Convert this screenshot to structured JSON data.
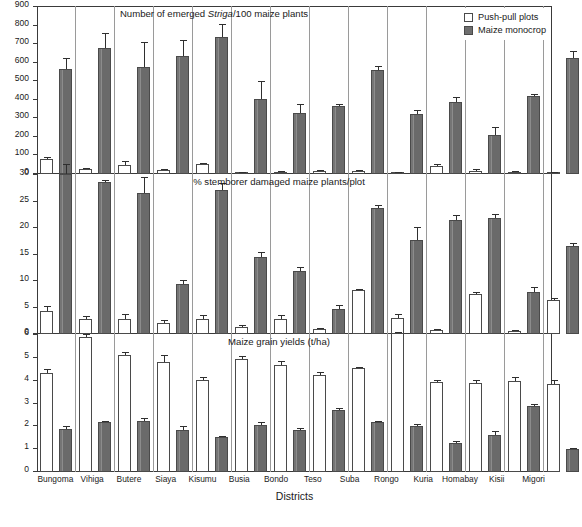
{
  "figure": {
    "xlabel": "Districts",
    "legend": [
      {
        "label": "Push-pull plots",
        "key": "push",
        "color": "#ffffff"
      },
      {
        "label": "Maize monocrop",
        "key": "mono",
        "color": "#6e6e6e"
      }
    ]
  },
  "chart_data": [
    {
      "type": "bar",
      "title": "Number of emerged Striga/100 maize plants",
      "title_parts": {
        "pre": "Number of emerged ",
        "italic": "Striga",
        "post": "/100 maize plants"
      },
      "xlabel": "",
      "ylabel": "",
      "ylim": [
        0,
        900
      ],
      "yticks": [
        0,
        100,
        200,
        300,
        400,
        500,
        600,
        700,
        800,
        900
      ],
      "grid": false,
      "legend_position": "top-right",
      "categories": [
        "Bungoma",
        "Vihiga",
        "Butere",
        "Siaya",
        "Kisumu",
        "Busia",
        "Bondo",
        "Teso",
        "Suba",
        "Rongo",
        "Kuria",
        "Homabay",
        "Kisii",
        "Migori"
      ],
      "series": [
        {
          "name": "Push-pull plots",
          "values": [
            82,
            25,
            51,
            23,
            52,
            8,
            12,
            18,
            17,
            5,
            44,
            18,
            13,
            6
          ],
          "errors": [
            8,
            7,
            17,
            6,
            8,
            5,
            6,
            5,
            5,
            4,
            12,
            7,
            5,
            4
          ]
        },
        {
          "name": "Maize monocrop",
          "values": [
            565,
            681,
            578,
            634,
            739,
            403,
            327,
            364,
            563,
            325,
            390,
            208,
            422,
            627
          ],
          "errors": [
            58,
            80,
            133,
            89,
            67,
            100,
            48,
            16,
            21,
            20,
            23,
            47,
            9,
            38
          ]
        }
      ]
    },
    {
      "type": "bar",
      "title": "% stemborer damaged maize plants/plot",
      "xlabel": "",
      "ylabel": "",
      "ylim": [
        0,
        30
      ],
      "yticks": [
        0,
        5,
        10,
        15,
        20,
        25,
        30
      ],
      "grid": false,
      "categories": [
        "Bungoma",
        "Vihiga",
        "Butere",
        "Siaya",
        "Kisumu",
        "Busia",
        "Bondo",
        "Teso",
        "Suba",
        "Rongo",
        "Kuria",
        "Homabay",
        "Kisii",
        "Migori"
      ],
      "series": [
        {
          "name": "Push-pull plots",
          "values": [
            4.3,
            2.9,
            2.9,
            2.1,
            2.9,
            1.4,
            2.8,
            0.9,
            8.3,
            3.0,
            0.8,
            7.6,
            0.5,
            6.5
          ],
          "errors": [
            0.9,
            0.5,
            0.8,
            0.5,
            0.7,
            0.3,
            0.8,
            0.3,
            0.2,
            0.8,
            0.2,
            0.3,
            0.2,
            0.3
          ]
        },
        {
          "name": "Maize monocrop",
          "values": [
            30.2,
            28.6,
            26.7,
            9.5,
            27.2,
            14.6,
            11.9,
            4.8,
            23.8,
            17.7,
            21.6,
            21.8,
            8.0,
            16.6
          ],
          "errors": [
            1.8,
            0.5,
            2.9,
            0.6,
            1.3,
            0.8,
            0.8,
            0.6,
            0.6,
            2.4,
            0.9,
            0.9,
            0.8,
            0.5
          ]
        }
      ]
    },
    {
      "type": "bar",
      "title": "Maize grain yields (t/ha)",
      "xlabel": "Districts",
      "ylabel": "",
      "ylim": [
        0,
        6
      ],
      "yticks": [
        0,
        1,
        2,
        3,
        4,
        5,
        6
      ],
      "grid": false,
      "categories": [
        "Bungoma",
        "Vihiga",
        "Butere",
        "Siaya",
        "Kisumu",
        "Busia",
        "Bondo",
        "Teso",
        "Suba",
        "Rongo",
        "Kuria",
        "Homabay",
        "Kisii",
        "Migori"
      ],
      "series": [
        {
          "name": "Push-pull plots",
          "values": [
            4.35,
            5.9,
            5.12,
            4.81,
            4.02,
            4.94,
            4.67,
            4.27,
            4.54,
            6.08,
            3.95,
            3.9,
            4.0,
            3.86
          ],
          "errors": [
            0.18,
            0.14,
            0.14,
            0.3,
            0.13,
            0.13,
            0.18,
            0.12,
            0.07,
            0.06,
            0.08,
            0.12,
            0.16,
            0.17
          ]
        },
        {
          "name": "Maize monocrop",
          "values": [
            1.9,
            2.17,
            2.25,
            1.85,
            1.52,
            2.07,
            1.84,
            2.73,
            2.19,
            2.02,
            1.28,
            1.61,
            2.89,
            1.0
          ],
          "errors": [
            0.12,
            0.08,
            0.11,
            0.15,
            0.05,
            0.11,
            0.1,
            0.07,
            0.06,
            0.07,
            0.06,
            0.19,
            0.1,
            0.06
          ]
        }
      ]
    }
  ]
}
